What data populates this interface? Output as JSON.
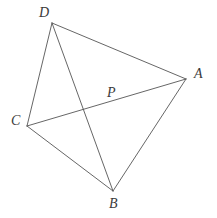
{
  "figure": {
    "type": "geometry-diagram",
    "width": 217,
    "height": 218,
    "background_color": "#ffffff",
    "line_color": "#555555",
    "label_color": "#3a3a3a"
  },
  "points": {
    "A": {
      "label": "A",
      "x": 186,
      "y": 79,
      "label_x": 194,
      "label_y": 67
    },
    "B": {
      "label": "B",
      "x": 113,
      "y": 191,
      "label_x": 109,
      "label_y": 197
    },
    "C": {
      "label": "C",
      "x": 27,
      "y": 126,
      "label_x": 11,
      "label_y": 114
    },
    "D": {
      "label": "D",
      "x": 52,
      "y": 23,
      "label_x": 39,
      "label_y": 6
    },
    "P": {
      "label": "P",
      "x": 106,
      "y": 104,
      "label_x": 107,
      "label_y": 86
    }
  },
  "segments": [
    {
      "name": "segment-DA",
      "from": "D",
      "to": "A",
      "kind": "side"
    },
    {
      "name": "segment-AB",
      "from": "A",
      "to": "B",
      "kind": "side"
    },
    {
      "name": "segment-BC",
      "from": "B",
      "to": "C",
      "kind": "side"
    },
    {
      "name": "segment-CD",
      "from": "C",
      "to": "D",
      "kind": "side"
    },
    {
      "name": "segment-CA",
      "from": "C",
      "to": "A",
      "kind": "diagonal"
    },
    {
      "name": "segment-DB",
      "from": "D",
      "to": "B",
      "kind": "diagonal"
    }
  ]
}
